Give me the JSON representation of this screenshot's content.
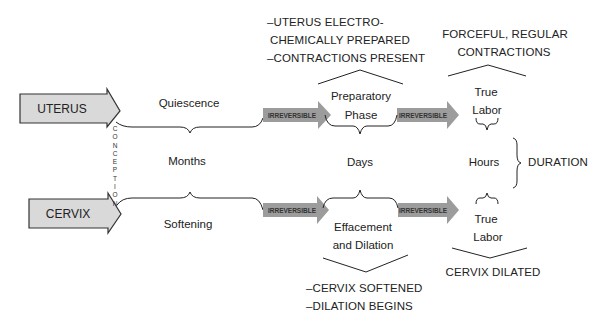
{
  "diagram": {
    "rows": {
      "uterus": {
        "label": "UTERUS",
        "stages": [
          "Quiescence",
          "Preparatory",
          "Phase",
          "True",
          "Labor"
        ]
      },
      "cervix": {
        "label": "CERVIX",
        "stages": [
          "Softening",
          "Effacement",
          "and Dilation",
          "True",
          "Labor"
        ]
      }
    },
    "vertical_marker": [
      "C",
      "O",
      "N",
      "C",
      "E",
      "P",
      "T",
      "I",
      "O",
      "N"
    ],
    "transition_label": "IRREVERSIBLE",
    "transitions": [
      "IRREVERSIBLE",
      "IRREVERSIBLE",
      "IRREVERSIBLE",
      "IRREVERSIBLE"
    ],
    "durations": {
      "phase1": "Months",
      "phase2": "Days",
      "phase3": "Hours",
      "summary": "DURATION"
    },
    "annotations": {
      "uterus_prepared": [
        "–UTERUS ELECTRO-",
        "CHEMICALLY PREPARED",
        "–CONTRACTIONS PRESENT"
      ],
      "uterus_labor": [
        "FORCEFUL, REGULAR",
        "CONTRACTIONS"
      ],
      "cervix_prepared": [
        "–CERVIX SOFTENED",
        "–DILATION BEGINS"
      ],
      "cervix_labor": [
        "CERVIX DILATED"
      ]
    },
    "colors": {
      "box_fill": "#d9d9d9",
      "box_stroke": "#333333",
      "transition_fill": "#9c9c9c",
      "line": "#222222"
    }
  }
}
